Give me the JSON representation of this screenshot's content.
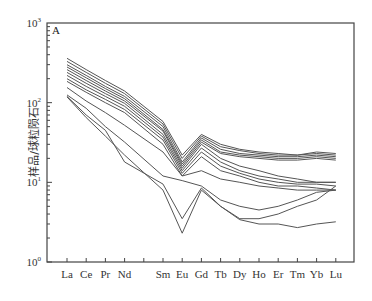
{
  "chart_data": {
    "type": "line",
    "title": "",
    "panel_label": "A",
    "xlabel": "",
    "ylabel": "样品/球粒陨石",
    "yscale": "log",
    "ylim": [
      1,
      1000
    ],
    "y_ticks": [
      {
        "base": "10",
        "exp": "0",
        "value": 1
      },
      {
        "base": "10",
        "exp": "1",
        "value": 10
      },
      {
        "base": "10",
        "exp": "2",
        "value": 100
      },
      {
        "base": "10",
        "exp": "3",
        "value": 1000
      }
    ],
    "categories": [
      "La",
      "Ce",
      "Pr",
      "Nd",
      "Pm",
      "Sm",
      "Eu",
      "Gd",
      "Tb",
      "Dy",
      "Ho",
      "Er",
      "Tm",
      "Yb",
      "Lu"
    ],
    "category_labels": [
      "La",
      "Ce",
      "Pr",
      "Nd",
      "",
      "Sm",
      "Eu",
      "Gd",
      "Tb",
      "Dy",
      "Ho",
      "Er",
      "Tm",
      "Yb",
      "Lu"
    ],
    "grid": false,
    "legend": null,
    "series": [
      {
        "name": "s1",
        "values": [
          360,
          260,
          190,
          140,
          null,
          58,
          22,
          40,
          30,
          26,
          24,
          23,
          22,
          24,
          23
        ]
      },
      {
        "name": "s2",
        "values": [
          330,
          240,
          175,
          130,
          null,
          54,
          20,
          38,
          28,
          25,
          23,
          22,
          22,
          23,
          22
        ]
      },
      {
        "name": "s3",
        "values": [
          300,
          220,
          160,
          120,
          null,
          50,
          18,
          36,
          26,
          23,
          22,
          21,
          21,
          22,
          21
        ]
      },
      {
        "name": "s4",
        "values": [
          280,
          205,
          150,
          112,
          null,
          46,
          17,
          34,
          24,
          22,
          21,
          20,
          20,
          21,
          20
        ]
      },
      {
        "name": "s5",
        "values": [
          260,
          190,
          140,
          105,
          null,
          44,
          16,
          32,
          23,
          21,
          20,
          19,
          19,
          20,
          19
        ]
      },
      {
        "name": "s6",
        "values": [
          240,
          175,
          130,
          98,
          null,
          40,
          15,
          30,
          20,
          16,
          14,
          12,
          11,
          10,
          10
        ]
      },
      {
        "name": "s7",
        "values": [
          220,
          160,
          120,
          90,
          null,
          37,
          14,
          27,
          18,
          14,
          12,
          11,
          10,
          10,
          10
        ]
      },
      {
        "name": "s8",
        "values": [
          200,
          145,
          110,
          82,
          null,
          34,
          13,
          24,
          16,
          13,
          11,
          10,
          9.5,
          9.5,
          9
        ],
        "note": ""
      },
      {
        "name": "s9",
        "values": [
          185,
          135,
          100,
          75,
          null,
          30,
          12,
          21,
          14,
          12,
          10,
          9,
          9,
          8.5,
          8
        ]
      },
      {
        "name": "s10",
        "values": [
          155,
          105,
          75,
          52,
          null,
          24,
          12,
          14,
          11,
          10,
          9,
          8.5,
          8,
          8,
          8
        ]
      },
      {
        "name": "s11",
        "values": [
          125,
          85,
          50,
          32,
          null,
          12,
          10.5,
          9,
          6,
          5,
          4.5,
          5,
          6,
          7.5,
          8
        ]
      },
      {
        "name": "s12",
        "values": [
          120,
          70,
          45,
          18,
          null,
          9.5,
          3.5,
          8.5,
          5,
          3.5,
          3.5,
          4,
          5,
          6,
          9
        ]
      },
      {
        "name": "s13",
        "values": [
          118,
          65,
          38,
          22,
          null,
          8,
          2.3,
          8,
          5,
          3.4,
          3,
          3,
          2.7,
          3,
          3.2
        ]
      }
    ]
  }
}
